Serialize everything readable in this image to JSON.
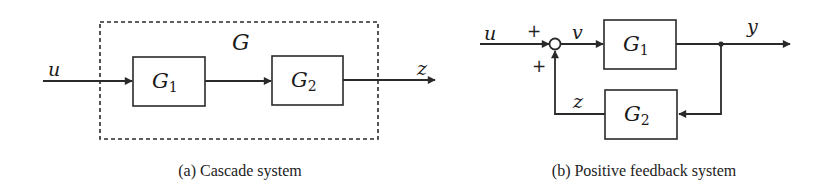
{
  "panels": {
    "cascade": {
      "caption": "(a) Cascade system",
      "group_label": "G",
      "input_label": "u",
      "output_label": "z",
      "blocks": [
        {
          "name": "G",
          "subscript": "1"
        },
        {
          "name": "G",
          "subscript": "2"
        }
      ]
    },
    "feedback": {
      "caption": "(b) Positive feedback system",
      "input_label": "u",
      "sum_signal_label": "v",
      "output_label": "y",
      "feedback_signal_label": "z",
      "sum_signs": {
        "top": "+",
        "bottom": "+"
      },
      "blocks": [
        {
          "name": "G",
          "subscript": "1"
        },
        {
          "name": "G",
          "subscript": "2"
        }
      ]
    }
  },
  "colors": {
    "stroke": "#2a2a2a",
    "background": "#ffffff"
  }
}
